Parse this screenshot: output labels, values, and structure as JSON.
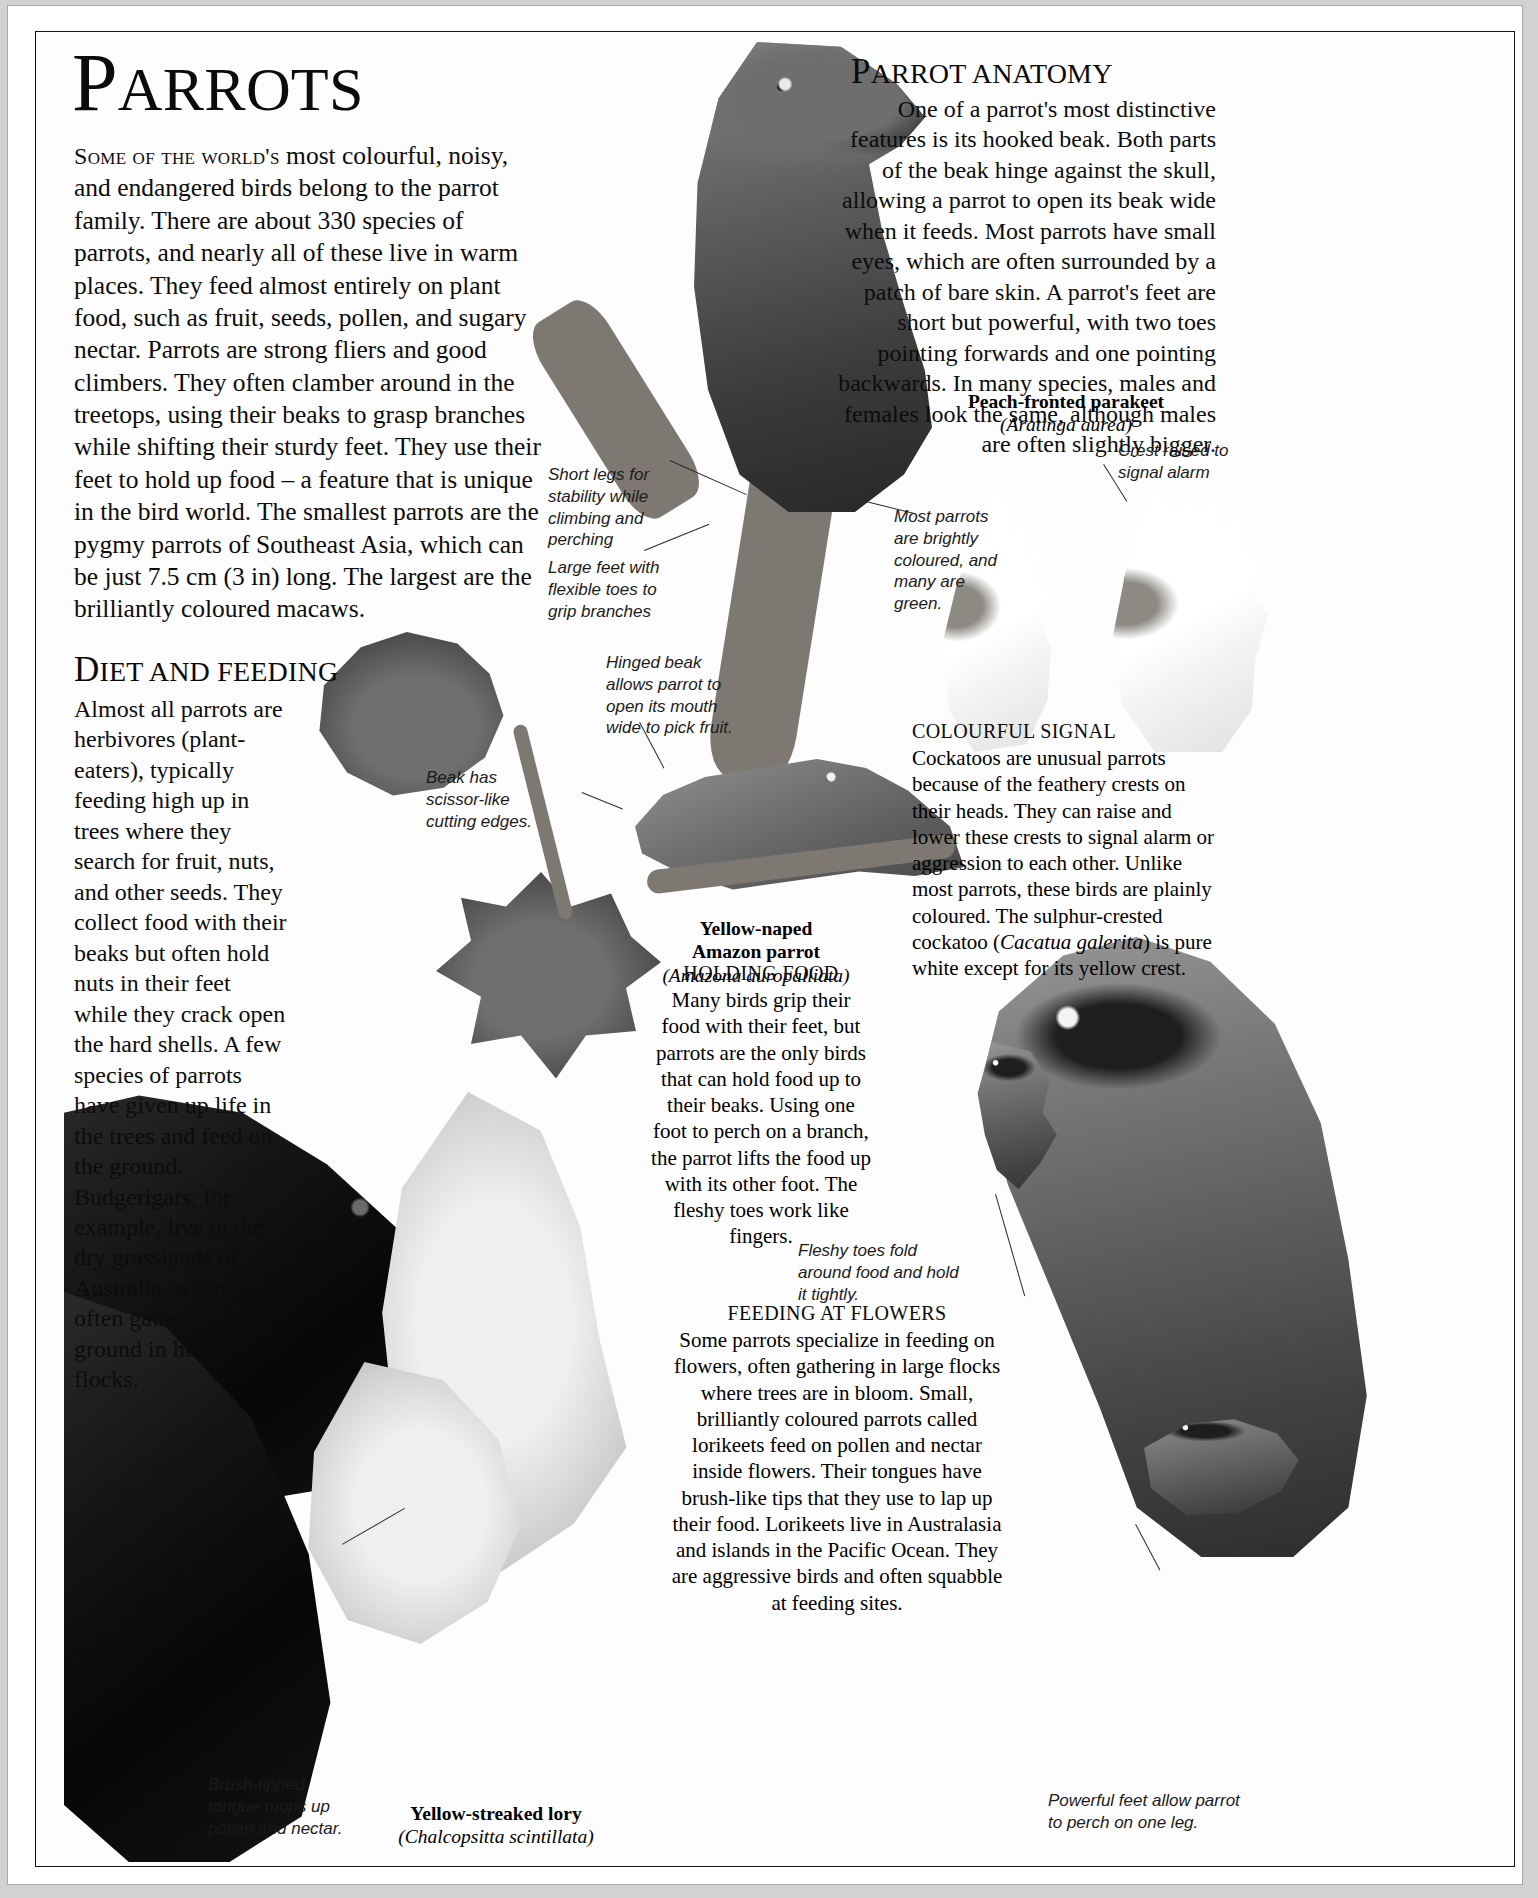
{
  "page": {
    "running_head": "PARROT FAMILY",
    "title": "Parrots",
    "title_cap": "P",
    "title_rest": "ARROTS"
  },
  "intro": {
    "lead_in": "Some of the world's",
    "body": "most colourful, noisy, and endangered birds belong to the parrot family. There are about 330 species of parrots, and nearly all of these live in warm places. They feed almost entirely on plant food, such as fruit, seeds, pollen, and sugary nectar. Parrots are strong fliers and good climbers. They often clamber around in the treetops, using their beaks to grasp branches while shifting their sturdy feet. They use their feet to hold up food – a feature that is unique in the bird world. The smallest parrots are the pygmy parrots of Southeast Asia, which can be just 7.5 cm (3 in) long. The largest are the brilliantly coloured macaws."
  },
  "anatomy": {
    "heading_cap": "P",
    "heading_rest": "ARROT ANATOMY",
    "body": "One of a parrot's most distinctive features is its hooked beak. Both parts of the beak hinge against the skull, allowing a parrot to open its beak wide when it feeds. Most parrots have small eyes, which are often surrounded by a patch of bare skin. A parrot's feet are short but powerful, with two toes pointing forwards and one pointing backwards. In many species, males and females look the same, although males are often slightly bigger."
  },
  "diet": {
    "heading_cap": "D",
    "heading_rest": "IET AND FEEDING",
    "body": "Almost all parrots are herbivores (plant-eaters), typically feeding high up in trees where they search for fruit, nuts, and other seeds. They collect food with their beaks but often hold nuts in their feet while they crack open the hard shells. A few species of parrots have given up life in the trees and feed on the ground. Budgerigars, for example, live in the dry grasslands of Australia, where they often gather on the ground in huge flocks."
  },
  "colourful_signal": {
    "heading": "COLOURFUL SIGNAL",
    "body": "Cockatoos are unusual parrots because of the feathery crests on their heads. They can raise and lower these crests to signal alarm or aggression to each other. Unlike most parrots, these birds are plainly coloured. The sulphur-crested cockatoo (Cacatua galerita) is pure white except for its yellow crest.",
    "body_part1": "Cockatoos are unusual parrots because of the feathery crests on their heads. They can raise and lower these crests to signal alarm or aggression to each other. Unlike most parrots, these birds are plainly coloured. The sulphur-crested cockatoo (",
    "species_italic": "Cacatua galerita",
    "body_part2": ") is pure white except for its yellow crest."
  },
  "holding_food": {
    "heading": "HOLDING FOOD",
    "body": "Many birds grip their food with their feet, but parrots are the only birds that can hold food up to their beaks. Using one foot to perch on a branch, the parrot lifts the food up with its other foot. The fleshy toes work like fingers."
  },
  "feeding_flowers": {
    "heading": "FEEDING AT FLOWERS",
    "body": "Some parrots specialize in feeding on flowers, often gathering in large flocks where trees are in bloom. Small, brilliantly coloured parrots called lorikeets feed on pollen and nectar inside flowers. Their tongues have brush-like tips that they use to lap up their food. Lorikeets live in Australasia and islands in the Pacific Ocean. They are aggressive birds and often squabble at feeding sites."
  },
  "captions": [
    {
      "id": "peach-fronted-parakeet",
      "common": "Peach-fronted parakeet",
      "latin": "(Aratinga aurea)"
    },
    {
      "id": "yellow-naped-amazon",
      "common_line1": "Yellow-naped",
      "common_line2": "Amazon parrot",
      "latin": "(Amazona auropalliata)"
    },
    {
      "id": "yellow-streaked-lory",
      "common": "Yellow-streaked lory",
      "latin": "(Chalcopsitta scintillata)"
    }
  ],
  "annotations": [
    {
      "id": "short-legs",
      "text": "Short legs for stability while climbing and perching"
    },
    {
      "id": "large-feet",
      "text": "Large feet with flexible toes to grip branches"
    },
    {
      "id": "most-parrots-green",
      "text": "Most parrots are brightly coloured, and many are green."
    },
    {
      "id": "crest-raised",
      "text": "Crest raised to signal alarm"
    },
    {
      "id": "hinged-beak",
      "text": "Hinged beak allows parrot to open its mouth wide to pick fruit."
    },
    {
      "id": "scissor-beak",
      "text": "Beak has scissor-like cutting edges."
    },
    {
      "id": "fleshy-toes",
      "text": "Fleshy toes fold around food and hold it tightly."
    },
    {
      "id": "brush-tongue",
      "text": "Brush-tipped tongue mops up pollen and nectar."
    },
    {
      "id": "powerful-feet",
      "text": "Powerful feet allow parrot to perch on one leg."
    }
  ],
  "colors": {
    "page_bg": "#ffffff",
    "frame": "#141414",
    "text": "#0c0c0c",
    "board": "#d2d2d2"
  }
}
